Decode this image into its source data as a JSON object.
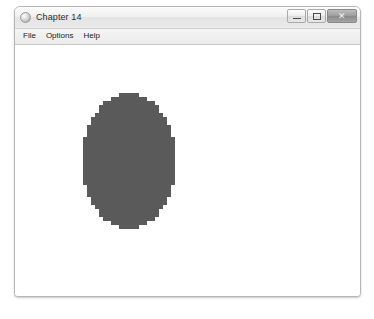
{
  "window": {
    "title": "Chapter 14",
    "app_icon": "app-circle-icon",
    "controls": [
      {
        "name": "minimize",
        "label": "—",
        "glyph": "minimize-icon"
      },
      {
        "name": "maximize",
        "label": "□",
        "glyph": "maximize-icon"
      },
      {
        "name": "close",
        "label": "✕",
        "glyph": "close-icon"
      }
    ]
  },
  "menubar": {
    "items": [
      {
        "label": "File"
      },
      {
        "label": "Options"
      },
      {
        "label": "Help"
      }
    ]
  },
  "canvas": {
    "background": "#ffffff",
    "shape": {
      "type": "ellipse",
      "style": "rasterized-blocky",
      "fill_color": "#5a5a5a",
      "center_x": 115,
      "center_y": 153,
      "radius_x": 47,
      "radius_y": 68,
      "block_size": 4
    }
  }
}
